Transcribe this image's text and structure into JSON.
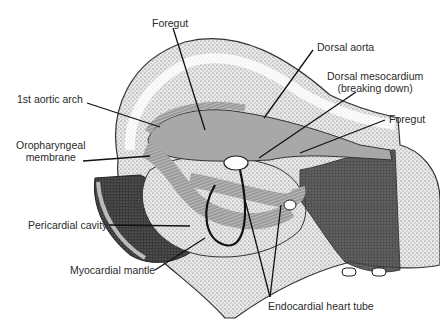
{
  "figure": {
    "labels": {
      "foregut_top": "Foregut",
      "dorsal_aorta": "Dorsal aorta",
      "dorsal_mesocardium_line1": "Dorsal mesocardium",
      "dorsal_mesocardium_line2": "(breaking down)",
      "foregut_right": "Foregut",
      "aortic_arch": "1st aortic arch",
      "oropharyngeal_line1": "Oropharyngeal",
      "oropharyngeal_line2": "membrane",
      "pericardial_cavity": "Pericardial cavity",
      "myocardial_mantle": "Myocardial mantle",
      "endocardial_heart_tube": "Endocardial heart tube"
    }
  }
}
